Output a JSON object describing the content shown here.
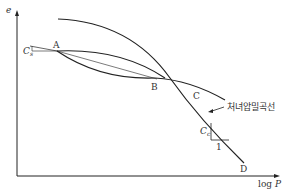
{
  "diagram": {
    "type": "e-logP consolidation curve",
    "axes": {
      "y_label": "e",
      "x_label_prefix": "log ",
      "x_label_var": "P"
    },
    "points": {
      "A": "A",
      "B": "B",
      "C": "C",
      "D": "D"
    },
    "labels": {
      "cs_main": "C",
      "cs_sub": "s",
      "cc_main": "C",
      "cc_sub": "c",
      "slope_run": "1",
      "virgin_curve": "처녀압밀곡선"
    },
    "colors": {
      "line": "#222222",
      "text": "#333333",
      "background": "#ffffff"
    }
  }
}
